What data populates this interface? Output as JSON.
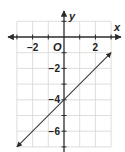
{
  "chart_data": {
    "type": "line",
    "title": "",
    "xlabel": "x",
    "ylabel": "y",
    "origin_label": "O",
    "xlim": [
      -3,
      3
    ],
    "ylim": [
      -7,
      1
    ],
    "grid": true,
    "x_tick_labels": [
      {
        "value": -2,
        "label": "−2"
      },
      {
        "value": 2,
        "label": "2"
      }
    ],
    "y_tick_labels": [
      {
        "value": -2,
        "label": "−2"
      },
      {
        "value": -4,
        "label": "−4"
      },
      {
        "value": -6,
        "label": "−6"
      }
    ],
    "series": [
      {
        "name": "y = x − 4",
        "slope": 1,
        "intercept": -4,
        "x": [
          -3,
          3
        ],
        "y": [
          -7,
          -1
        ],
        "arrows_both_ends": true,
        "color": "#3a3a3a"
      }
    ]
  }
}
